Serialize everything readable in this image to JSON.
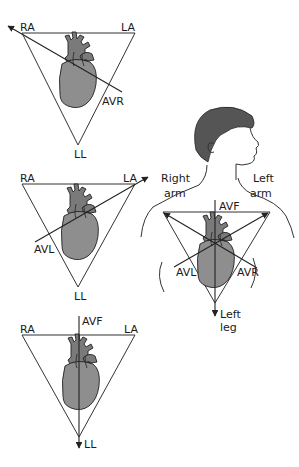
{
  "diagram": {
    "panels": [
      {
        "id": "avr",
        "labels": {
          "ra": "RA",
          "la": "LA",
          "ll": "LL",
          "lead": "AVR"
        },
        "lead_direction": "toward RA (upper-left)"
      },
      {
        "id": "avl",
        "labels": {
          "ra": "RA",
          "la": "LA",
          "ll": "LL",
          "lead": "AVL"
        },
        "lead_direction": "toward LA (upper-right)"
      },
      {
        "id": "avf",
        "labels": {
          "ra": "RA",
          "la": "LA",
          "ll": "LL",
          "lead": "AVF"
        },
        "lead_direction": "toward LL (down)"
      }
    ],
    "figure": {
      "right_arm": [
        "Right",
        "arm"
      ],
      "left_arm": [
        "Left",
        "arm"
      ],
      "left_leg": [
        "Left",
        "leg"
      ],
      "avf": "AVF",
      "avl": "AVL",
      "avr": "AVR"
    },
    "colors": {
      "line": "#222222",
      "heart": "#8e8e8e",
      "hair": "#555555"
    }
  }
}
